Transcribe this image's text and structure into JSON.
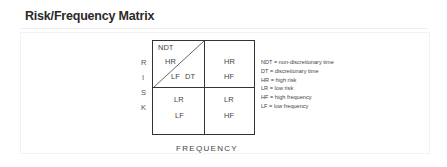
{
  "title": "Risk/Frequency Matrix",
  "y_axis_letters": [
    "R",
    "I",
    "S",
    "K"
  ],
  "x_axis_label": "FREQUENCY",
  "matrix": {
    "top_left": {
      "corner": "NDT",
      "upper": "HR",
      "lower_left": "LF",
      "lower_right": "DT"
    },
    "top_right": {
      "line1": "HR",
      "line2": "HF"
    },
    "bottom_left": {
      "line1": "LR",
      "line2": "LF"
    },
    "bottom_right": {
      "line1": "LR",
      "line2": "HF"
    }
  },
  "legend": [
    "NDT = non-discretionary time",
    "DT = discretionary time",
    "HR = high risk",
    "LR = low risk",
    "HF = high frequency",
    "LF = low frequency"
  ]
}
